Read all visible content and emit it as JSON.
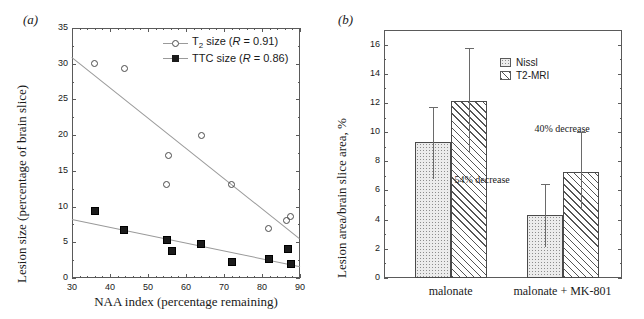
{
  "figure": {
    "panel_a_label": "(a)",
    "panel_b_label": "(b)"
  },
  "chart_data": [
    {
      "type": "scatter",
      "panel": "(a)",
      "title": "",
      "xlabel": "NAA index (percentage remaining)",
      "ylabel": "Lesion size (percentage of brain slice)",
      "xlim": [
        30,
        90
      ],
      "ylim": [
        0,
        35
      ],
      "xticks": [
        30,
        40,
        50,
        60,
        70,
        80,
        90
      ],
      "yticks": [
        0,
        5,
        10,
        15,
        20,
        25,
        30,
        35
      ],
      "grid": false,
      "legend_position": "top-right",
      "series": [
        {
          "name": "T2 size (R = 0.91)",
          "label_main": "size (",
          "label_sym": "T",
          "label_sub": "2",
          "label_r": "R",
          "label_rval": " = 0.91)",
          "marker": "open-circle",
          "points": [
            {
              "x": 36.0,
              "y": 30.0
            },
            {
              "x": 43.8,
              "y": 29.3
            },
            {
              "x": 54.8,
              "y": 13.1
            },
            {
              "x": 55.5,
              "y": 17.1
            },
            {
              "x": 64.0,
              "y": 20.0
            },
            {
              "x": 72.0,
              "y": 13.1
            },
            {
              "x": 81.8,
              "y": 7.0
            },
            {
              "x": 86.5,
              "y": 8.1
            },
            {
              "x": 87.5,
              "y": 8.6
            }
          ],
          "fit": {
            "x1": 30,
            "y1": 31.0,
            "x2": 90,
            "y2": 5.6
          }
        },
        {
          "name": "TTC size (R = 0.86)",
          "label_main": "TTC size (",
          "label_r": "R",
          "label_rval": " = 0.86)",
          "marker": "filled-square",
          "points": [
            {
              "x": 36.0,
              "y": 9.4
            },
            {
              "x": 43.8,
              "y": 6.7
            },
            {
              "x": 54.9,
              "y": 5.3
            },
            {
              "x": 56.2,
              "y": 3.8
            },
            {
              "x": 64.0,
              "y": 4.7
            },
            {
              "x": 72.0,
              "y": 2.2
            },
            {
              "x": 81.8,
              "y": 2.6
            },
            {
              "x": 86.8,
              "y": 4.0
            },
            {
              "x": 87.6,
              "y": 2.0
            }
          ],
          "fit": {
            "x1": 30,
            "y1": 8.2,
            "x2": 90,
            "y2": 1.6
          }
        }
      ]
    },
    {
      "type": "bar",
      "panel": "(b)",
      "title": "",
      "xlabel": "",
      "ylabel": "Lesion area/brain slice area, %",
      "ylim": [
        0,
        17
      ],
      "yticks": [
        0,
        2,
        4,
        6,
        8,
        10,
        12,
        14,
        16
      ],
      "grid": false,
      "legend_position": "top-right",
      "categories": [
        "malonate",
        "malonate + MK-801"
      ],
      "series": [
        {
          "name": "Nissl",
          "fill": "dotted",
          "values": [
            9.3,
            4.3
          ],
          "err_low": [
            2.5,
            2.15
          ],
          "err_high": [
            2.45,
            2.15
          ]
        },
        {
          "name": "T2-MRI",
          "fill": "hatched",
          "values": [
            12.1,
            7.3
          ],
          "err_low": [
            3.55,
            2.6
          ],
          "err_high": [
            3.65,
            2.7
          ]
        }
      ],
      "annotations": [
        {
          "text": "54% decrease",
          "series": "Nissl",
          "category": "malonate + MK-801"
        },
        {
          "text": "40% decrease",
          "series": "T2-MRI",
          "category": "malonate + MK-801"
        }
      ]
    }
  ],
  "panel_a": {
    "ylabel": "Lesion size (percentage of brain slice)",
    "xlabel": "NAA index (percentage remaining)",
    "yticklabels": [
      "0",
      "5",
      "10",
      "15",
      "20",
      "25",
      "30",
      "35"
    ],
    "xticklabels": [
      "30",
      "40",
      "50",
      "60",
      "70",
      "80",
      "90"
    ],
    "legend": {
      "t2_sym": "T",
      "t2_sub": "2",
      "t2_mid": " size (",
      "r_italic": "R",
      "t2_tail": " = 0.91)",
      "ttc_head": "TTC size (",
      "ttc_tail": " = 0.86)"
    }
  },
  "panel_b": {
    "ylabel": "Lesion area/brain slice area, %",
    "yticklabels": [
      "0",
      "2",
      "4",
      "6",
      "8",
      "10",
      "12",
      "14",
      "16"
    ],
    "group_labels": [
      "malonate",
      "malonate + MK-801"
    ],
    "legend": {
      "nissl": "Nissl",
      "t2mri": "T2-MRI"
    },
    "annotation_54": "54% decrease",
    "annotation_40": "40% decrease"
  },
  "colors": {
    "axis": "#5a5a5a",
    "fit_line": "#9a9a9a",
    "marker_filled": "#1b1b1b",
    "marker_open_stroke": "#4a4a4a",
    "bar_dot_fill": "#ececec",
    "bar_hatch_stroke": "#555555",
    "error_bar": "#6a6a6a",
    "text": "#1a1a1a"
  }
}
